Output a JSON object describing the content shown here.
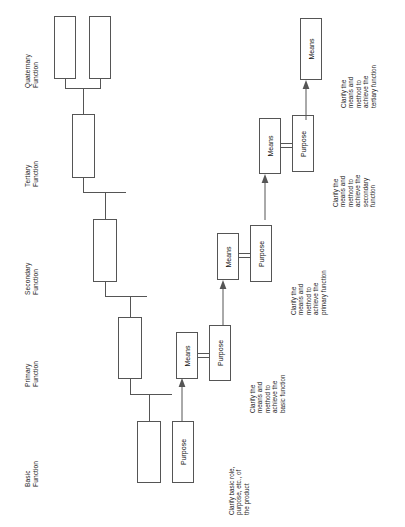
{
  "diagram": {
    "orientation": "rotated-90",
    "line_color": "#555555",
    "text_color": "#222222",
    "background": "#ffffff"
  },
  "levels": [
    {
      "id": "basic",
      "label": "Basic\nFunction"
    },
    {
      "id": "primary",
      "label": "Primary\nFunction"
    },
    {
      "id": "secondary",
      "label": "Secondary\nFunction"
    },
    {
      "id": "tertiary",
      "label": "Tertiary\nFunction"
    },
    {
      "id": "quaternary",
      "label": "Quaternary\nFunction"
    }
  ],
  "tree_nodes": [
    {
      "id": "node-basic",
      "label": ""
    },
    {
      "id": "node-primary",
      "label": ""
    },
    {
      "id": "node-secondary",
      "label": ""
    },
    {
      "id": "node-tertiary",
      "label": ""
    },
    {
      "id": "node-quaternary-1",
      "label": ""
    },
    {
      "id": "node-quaternary-2",
      "label": ""
    }
  ],
  "pairs": [
    {
      "id": "pair-basic",
      "purpose_label": "Purpose",
      "means_label": "",
      "annotation": "Clarify basic role,\npurpose, etc., of\nthe product"
    },
    {
      "id": "pair-primary",
      "means_label": "Means",
      "purpose_label": "Purpose",
      "annotation": "Clarify the\nmeans and\nmethod to\nachieve the\nbasic function"
    },
    {
      "id": "pair-secondary",
      "means_label": "Means",
      "purpose_label": "Purpose",
      "annotation": "Clarify the\nmeans and\nmethod to\nachieve the\nprimary function"
    },
    {
      "id": "pair-tertiary",
      "means_label": "Means",
      "purpose_label": "Purpose",
      "annotation": "Clarify the\nmeans and\nmethod to\nachieve the\nsecondary\nfunction"
    },
    {
      "id": "pair-quaternary",
      "means_label": "Means",
      "purpose_label": "",
      "annotation": "Clarify the\nmeans and\nmethod to\nachieve the\ntertiary function"
    }
  ]
}
